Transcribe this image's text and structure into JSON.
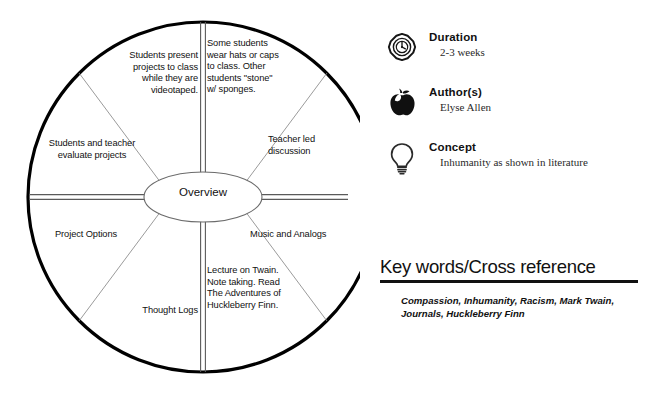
{
  "wheel": {
    "hub_label": "Overview",
    "sectors": [
      {
        "name": "hats",
        "text": "Some students wear hats or caps to class.  Other students \"stone\" w/ sponges.",
        "align": "left"
      },
      {
        "name": "teacher-led",
        "text": "Teacher led discussion",
        "align": "left"
      },
      {
        "name": "music",
        "text": "Music and Analogs",
        "align": "left"
      },
      {
        "name": "lecture",
        "text": "Lecture on Twain.  Note taking.  Read The Adventures of Huckleberry Finn.",
        "align": "left"
      },
      {
        "name": "thought-logs",
        "text": "Thought Logs",
        "align": "right"
      },
      {
        "name": "project-options",
        "text": "Project Options",
        "align": "left"
      },
      {
        "name": "evaluate",
        "text": "Students and teacher evaluate projects",
        "align": "center"
      },
      {
        "name": "present",
        "text": "Students present projects to class while they are videotaped.",
        "align": "right"
      }
    ]
  },
  "meta": {
    "rows": [
      {
        "icon": "stopwatch-icon",
        "title": "Duration",
        "value": "2-3 weeks"
      },
      {
        "icon": "apple-icon",
        "title": "Author(s)",
        "value": "Elyse Allen"
      },
      {
        "icon": "lightbulb-icon",
        "title": "Concept",
        "value": "Inhumanity as shown in literature"
      }
    ]
  },
  "keywords": {
    "heading": "Key words/Cross reference",
    "list": "Compassion, Inhumanity, Racism, Mark Twain, Journals, Huckleberry Finn"
  },
  "colors": {
    "ink": "#111111",
    "rim": "#000000",
    "spoke_thin": "#8a8a8a",
    "background": "#ffffff"
  }
}
